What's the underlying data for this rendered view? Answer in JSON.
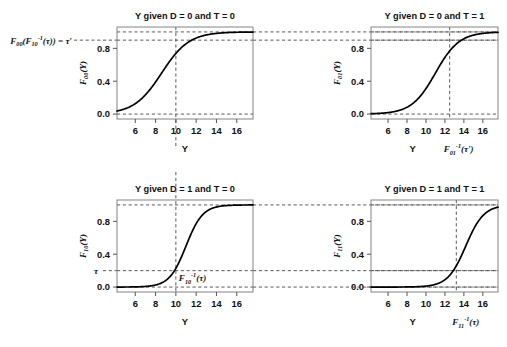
{
  "figure": {
    "background": "#ffffff",
    "curve_color": "#000000",
    "dash_color": "#4a4a4a",
    "axis_color": "#555555"
  },
  "global_annotations": {
    "left_label_main": "F",
    "left_label_full": "F00(F10^-1(τ)) = τ'",
    "tau_prime": "τ'",
    "tau": "τ"
  },
  "panels": [
    {
      "id": "panel-00",
      "title": "Y given D = 0 and T = 0",
      "ylabel": "F00(Y)",
      "ylabel_base": "F",
      "ylabel_sub": "00",
      "ylabel_tail": "(Y)",
      "xlabel": "Y",
      "xticks": [
        6,
        8,
        10,
        12,
        14,
        16
      ],
      "xtick_labels": [
        "6",
        "8",
        "10",
        "12",
        "14",
        "16"
      ],
      "yticks": [
        0.0,
        0.4,
        0.8
      ],
      "ytick_labels": [
        "0.0",
        "0.4",
        "0.8"
      ],
      "xlim": [
        4.2,
        17.6
      ],
      "ylim": [
        -0.06,
        1.06
      ],
      "vline_x": 10,
      "hline_y": 0.9,
      "hline_top": 1.0,
      "hline_bottom": 0.0,
      "vline_extends_below": true,
      "annotation": "",
      "annotation_sub": "",
      "left_edge_label": "F00(F10^-1(τ)) = τ'",
      "curve": {
        "center": 8.6,
        "scale": 1.35
      }
    },
    {
      "id": "panel-01",
      "title": "Y given D = 0 and T = 1",
      "ylabel": "F01(Y)",
      "ylabel_base": "F",
      "ylabel_sub": "01",
      "ylabel_tail": "(Y)",
      "xlabel": "Y",
      "xticks": [
        6,
        8,
        10,
        12,
        14,
        16
      ],
      "xtick_labels": [
        "6",
        "8",
        "10",
        "12",
        "14",
        "16"
      ],
      "yticks": [
        0.0,
        0.4,
        0.8
      ],
      "ytick_labels": [
        "0.0",
        "0.4",
        "0.8"
      ],
      "xlim": [
        4.2,
        17.6
      ],
      "ylim": [
        -0.06,
        1.06
      ],
      "vline_x": 12.5,
      "hline_y": 0.9,
      "hline_top": 1.0,
      "hline_bottom": 0.0,
      "vline_extends_below": false,
      "annotation": "F01^-1(τ')",
      "annotation_base": "F",
      "annotation_sub": "01",
      "annotation_sup": "-1",
      "annotation_tail": "(τ')",
      "curve": {
        "center": 11.0,
        "scale": 1.25
      }
    },
    {
      "id": "panel-10",
      "title": "Y given D = 1 and T = 0",
      "ylabel": "F10(Y)",
      "ylabel_base": "F",
      "ylabel_sub": "10",
      "ylabel_tail": "(Y)",
      "xlabel": "Y",
      "xticks": [
        6,
        8,
        10,
        12,
        14,
        16
      ],
      "xtick_labels": [
        "6",
        "8",
        "10",
        "12",
        "14",
        "16"
      ],
      "yticks": [
        0.0,
        0.4,
        0.8
      ],
      "ytick_labels": [
        "0.0",
        "0.4",
        "0.8"
      ],
      "xlim": [
        4.2,
        17.6
      ],
      "ylim": [
        -0.06,
        1.06
      ],
      "vline_x": 10,
      "hline_y": 0.2,
      "hline_top": 1.0,
      "hline_bottom": 0.0,
      "vline_extends_above": true,
      "tau_label": "τ",
      "annotation": "F10^-1(τ)",
      "annotation_base": "F",
      "annotation_sub": "10",
      "annotation_sup": "-1",
      "annotation_tail": "(τ)",
      "curve": {
        "center": 11.0,
        "scale": 0.82
      }
    },
    {
      "id": "panel-11",
      "title": "Y given D = 1 and T = 1",
      "ylabel": "F11(Y)",
      "ylabel_base": "F",
      "ylabel_sub": "11",
      "ylabel_tail": "(Y)",
      "xlabel": "Y",
      "xticks": [
        6,
        8,
        10,
        12,
        14,
        16
      ],
      "xtick_labels": [
        "6",
        "8",
        "10",
        "12",
        "14",
        "16"
      ],
      "yticks": [
        0.0,
        0.4,
        0.8
      ],
      "ytick_labels": [
        "0.0",
        "0.4",
        "0.8"
      ],
      "xlim": [
        4.2,
        17.6
      ],
      "ylim": [
        -0.06,
        1.06
      ],
      "vline_x": 13.2,
      "hline_y": 0.2,
      "hline_top": 1.0,
      "hline_bottom": 0.0,
      "vline_extends_below": false,
      "annotation": "F11^-1(τ)",
      "annotation_base": "F",
      "annotation_sub": "11",
      "annotation_sup": "-1",
      "annotation_tail": "(τ)",
      "curve": {
        "center": 14.2,
        "scale": 0.95
      }
    }
  ],
  "chart_data": {
    "type": "line",
    "subplots": 4,
    "layout": "2x2",
    "xlabel": "Y",
    "ylabel": "F(Y)",
    "xlim": [
      4.2,
      17.6
    ],
    "ylim": [
      -0.06,
      1.06
    ],
    "xticks": [
      6,
      8,
      10,
      12,
      14,
      16
    ],
    "yticks": [
      0.0,
      0.4,
      0.8
    ],
    "grid": false,
    "legend": "none",
    "series": [
      {
        "name": "F00(Y)",
        "panel": "Y given D = 0 and T = 0",
        "description": "logistic CDF, center 8.6, scale 1.35",
        "x": [
          4.2,
          5,
          6,
          7,
          8,
          9,
          10,
          11,
          12,
          13,
          14,
          15,
          16,
          17.6
        ],
        "values": [
          0.03,
          0.06,
          0.13,
          0.25,
          0.42,
          0.61,
          0.78,
          0.89,
          0.94,
          0.97,
          0.99,
          0.99,
          1.0,
          1.0
        ],
        "annotations": [
          {
            "type": "vline",
            "x": 10,
            "label": "10"
          },
          {
            "type": "hline",
            "y": 0.9,
            "label": "τ'"
          },
          {
            "type": "hline",
            "y": 1.0
          },
          {
            "type": "hline",
            "y": 0.0
          }
        ]
      },
      {
        "name": "F01(Y)",
        "panel": "Y given D = 0 and T = 1",
        "description": "logistic CDF, center 11.0, scale 1.25",
        "x": [
          4.2,
          5,
          6,
          7,
          8,
          9,
          10,
          11,
          12,
          13,
          14,
          15,
          16,
          17.6
        ],
        "values": [
          0.004,
          0.008,
          0.018,
          0.04,
          0.08,
          0.17,
          0.31,
          0.5,
          0.69,
          0.83,
          0.92,
          0.96,
          0.98,
          0.99
        ],
        "annotations": [
          {
            "type": "vline",
            "x": 12.5,
            "label": "F01^-1(τ')"
          },
          {
            "type": "hline",
            "y": 0.9,
            "label": "τ'"
          },
          {
            "type": "hline",
            "y": 1.0
          },
          {
            "type": "hline",
            "y": 0.0
          }
        ]
      },
      {
        "name": "F10(Y)",
        "panel": "Y given D = 1 and T = 0",
        "description": "logistic CDF, center 11.0, scale 0.82",
        "x": [
          4.2,
          6,
          7,
          8,
          9,
          10,
          11,
          12,
          13,
          14,
          15,
          16,
          17.6
        ],
        "values": [
          0.0,
          0.002,
          0.007,
          0.026,
          0.08,
          0.21,
          0.5,
          0.78,
          0.92,
          0.97,
          0.99,
          1.0,
          1.0
        ],
        "annotations": [
          {
            "type": "vline",
            "x": 10,
            "label": "F10^-1(τ)"
          },
          {
            "type": "hline",
            "y": 0.2,
            "label": "τ"
          },
          {
            "type": "hline",
            "y": 1.0
          },
          {
            "type": "hline",
            "y": 0.0
          }
        ]
      },
      {
        "name": "F11(Y)",
        "panel": "Y given D = 1 and T = 1",
        "description": "logistic CDF, center 14.2, scale 0.95",
        "x": [
          4.2,
          8,
          10,
          11,
          12,
          13,
          14,
          15,
          16,
          17,
          17.6
        ],
        "values": [
          0.0,
          0.001,
          0.01,
          0.03,
          0.08,
          0.22,
          0.48,
          0.74,
          0.89,
          0.96,
          0.98
        ],
        "annotations": [
          {
            "type": "vline",
            "x": 13.2,
            "label": "F11^-1(τ)"
          },
          {
            "type": "hline",
            "y": 0.2,
            "label": "τ"
          },
          {
            "type": "hline",
            "y": 1.0
          },
          {
            "type": "hline",
            "y": 0.0
          }
        ]
      }
    ]
  }
}
